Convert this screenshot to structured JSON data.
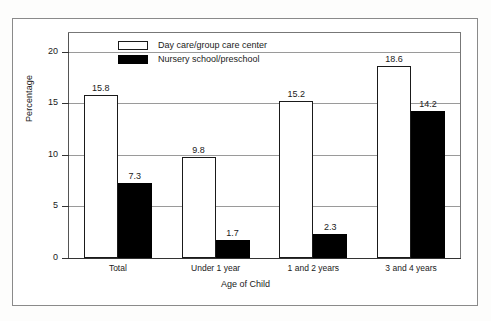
{
  "chart_data": {
    "type": "bar",
    "title": "",
    "xlabel": "Age of Child",
    "ylabel": "Percentage",
    "categories": [
      "Total",
      "Under 1 year",
      "1 and 2 years",
      "3 and 4 years"
    ],
    "series": [
      {
        "name": "Day care/group care center",
        "color": "#ffffff",
        "values": [
          15.8,
          9.8,
          15.2,
          18.6
        ]
      },
      {
        "name": "Nursery school/preschool",
        "color": "#000000",
        "values": [
          7.3,
          1.7,
          2.3,
          14.2
        ]
      }
    ],
    "ylim": [
      0,
      21.8
    ],
    "yticks": [
      0,
      5,
      10,
      15,
      20
    ],
    "ytick_labels": [
      "0",
      "5",
      "10",
      "15",
      "20"
    ],
    "grid": true,
    "legend_position": "top-left-inside",
    "value_labels": [
      [
        "15.8",
        "9.8",
        "15.2",
        "18.6"
      ],
      [
        "7.3",
        "1.7",
        "2.3",
        "14.2"
      ]
    ]
  },
  "legend": {
    "items": [
      {
        "label": "Day care/group care center",
        "swatch": "light"
      },
      {
        "label": "Nursery school/preschool",
        "swatch": "dark"
      }
    ]
  },
  "axes": {
    "y_title": "Percentage",
    "x_title": "Age of Child",
    "y_ticks": [
      "0",
      "5",
      "10",
      "15",
      "20"
    ],
    "x_categories": [
      "Total",
      "Under 1 year",
      "1 and 2 years",
      "3 and 4 years"
    ]
  }
}
